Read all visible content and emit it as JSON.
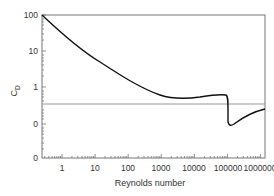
{
  "chart_data": {
    "type": "line",
    "title": "",
    "xlabel": "Reynolds number",
    "ylabel": "C_D",
    "ylabel_main": "C",
    "ylabel_sub": "D",
    "x_scale": "log",
    "y_scale": "log (broken)",
    "x_tick_labels": [
      "1",
      "10",
      "100",
      "1000",
      "10000",
      "100000",
      "1000000"
    ],
    "x_tick_values": [
      1,
      10,
      100,
      1000,
      10000,
      100000,
      1000000
    ],
    "y_tick_labels": [
      "100",
      "10",
      "1",
      "0",
      "0"
    ],
    "xlim": [
      0.25,
      1000000
    ],
    "grid": false,
    "legend": null,
    "reference_line": {
      "y_pixel": 104,
      "color": "#999999"
    },
    "series": [
      {
        "name": "Drag coefficient C_D",
        "color": "#111111",
        "x": [
          0.25,
          1,
          3,
          10,
          30,
          100,
          300,
          1000,
          3000,
          10000,
          30000,
          100000,
          200000,
          300000,
          400000,
          500000,
          1000000,
          3000000
        ],
        "y": [
          100,
          30,
          12,
          4.5,
          2.0,
          1.0,
          0.65,
          0.45,
          0.4,
          0.4,
          0.43,
          0.47,
          0.47,
          0.45,
          0.15,
          0.09,
          0.12,
          0.17
        ]
      }
    ]
  }
}
